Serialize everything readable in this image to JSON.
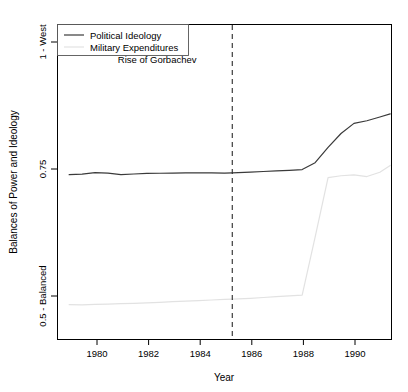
{
  "chart_data": {
    "type": "line",
    "title": "",
    "xlabel": "Year",
    "ylabel": "Balances of Power and Ideology",
    "xlim": [
      1978.55,
      1991.45
    ],
    "ylim": [
      0.4375,
      1.03
    ],
    "grid": false,
    "legend_position": "top-left",
    "xticks": [
      1980,
      1982,
      1984,
      1986,
      1988,
      1990
    ],
    "xtick_labels": [
      "1980",
      "1982",
      "1984",
      "1986",
      "1988",
      "1990"
    ],
    "yticks": [
      0.5,
      0.75,
      1.0
    ],
    "ytick_labels": [
      "0.5 - Balanced",
      "0.75",
      "1 - West"
    ],
    "x": [
      1979.0,
      1979.5,
      1980.0,
      1980.5,
      1981.0,
      1981.5,
      1982.0,
      1982.5,
      1983.0,
      1983.5,
      1984.0,
      1984.5,
      1985.0,
      1985.3,
      1986.0,
      1986.5,
      1987.0,
      1987.5,
      1988.0,
      1988.5,
      1989.0,
      1989.5,
      1990.0,
      1990.5,
      1991.0,
      1991.4
    ],
    "series": [
      {
        "name": "Political Ideology",
        "color": "#3a3a3a",
        "style": "solid",
        "values": [
          0.7475,
          0.7485,
          0.7515,
          0.7505,
          0.7475,
          0.7488,
          0.7498,
          0.7502,
          0.7505,
          0.7508,
          0.751,
          0.7508,
          0.7506,
          0.751,
          0.7525,
          0.7535,
          0.7548,
          0.7558,
          0.7572,
          0.77,
          0.799,
          0.825,
          0.844,
          0.849,
          0.856,
          0.862
        ]
      },
      {
        "name": "Military Expenditures",
        "color": "#e2e2e2",
        "style": "solid",
        "values": [
          0.503,
          0.5025,
          0.5035,
          0.504,
          0.5048,
          0.5055,
          0.5065,
          0.5075,
          0.5088,
          0.5098,
          0.5108,
          0.5118,
          0.5128,
          0.5133,
          0.515,
          0.5165,
          0.518,
          0.5195,
          0.521,
          0.63,
          0.742,
          0.7455,
          0.747,
          0.744,
          0.752,
          0.765
        ]
      }
    ],
    "annotations": [
      {
        "text": "Rise of Gorbachev",
        "x": 1982.4,
        "y": 0.958,
        "type": "text-label"
      },
      {
        "text": "",
        "x": 1985.3,
        "y": null,
        "type": "vertical-dashed-line"
      }
    ]
  },
  "legend": {
    "entries": [
      {
        "label": "Political Ideology",
        "color": "#3a3a3a"
      },
      {
        "label": "Military Expenditures",
        "color": "#e2e2e2"
      }
    ]
  },
  "axes": {
    "x_title": "Year",
    "y_title": "Balances of Power and Ideology"
  }
}
